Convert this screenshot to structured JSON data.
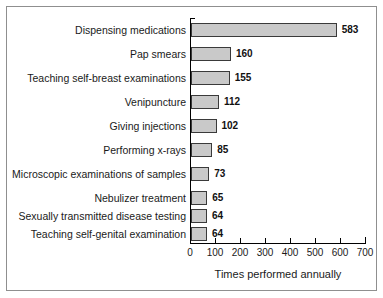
{
  "chart_data": {
    "type": "bar",
    "orientation": "horizontal",
    "title": "",
    "xlabel": "Times performed annually",
    "ylabel": "",
    "xlim": [
      0,
      700
    ],
    "xticks": [
      0,
      100,
      200,
      300,
      400,
      500,
      600,
      700
    ],
    "xtick_labels": [
      "0",
      "100",
      "200",
      "300",
      "400",
      "500",
      "600",
      "700"
    ],
    "grid": false,
    "legend": false,
    "bar_fill_color": "#c9c9c9",
    "bar_edge_color": "#3a3a3a",
    "categories": [
      "Dispensing medications",
      "Pap smears",
      "Teaching self-breast examinations",
      "Venipuncture",
      "Giving injections",
      "Performing x-rays",
      "Microscopic examinations of samples",
      "Nebulizer treatment",
      "Sexually transmitted disease testing",
      "Teaching self-genital examination"
    ],
    "values": [
      583,
      160,
      155,
      112,
      102,
      85,
      73,
      65,
      64,
      64
    ],
    "value_labels": [
      "583",
      "160",
      "155",
      "112",
      "102",
      "85",
      "73",
      "65",
      "64",
      "64"
    ]
  }
}
